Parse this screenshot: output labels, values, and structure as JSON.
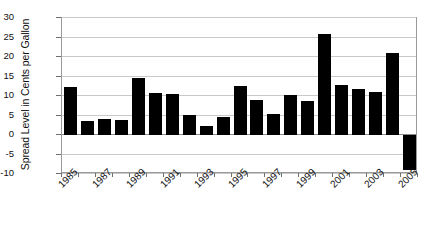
{
  "chart_data": {
    "type": "bar",
    "title": "",
    "subtitle": "",
    "xlabel": "",
    "ylabel": "Spread Level in Cents per Gallon",
    "categories": [
      "1985",
      "1986",
      "1987",
      "1988",
      "1989",
      "1990",
      "1991",
      "1992",
      "1993",
      "1994",
      "1995",
      "1996",
      "1997",
      "1998",
      "1999",
      "2000",
      "2001",
      "2002",
      "2003",
      "2004",
      "2005"
    ],
    "values": [
      12.2,
      3.7,
      4.1,
      3.9,
      14.5,
      10.7,
      10.4,
      5.2,
      2.4,
      4.6,
      12.6,
      9.0,
      5.3,
      10.2,
      8.7,
      25.9,
      12.8,
      11.8,
      10.9,
      20.9,
      -9.0
    ],
    "series": [
      {
        "name": "Spread Level",
        "values": [
          12.2,
          3.7,
          4.1,
          3.9,
          14.5,
          10.7,
          10.4,
          5.2,
          2.4,
          4.6,
          12.6,
          9.0,
          5.3,
          10.2,
          8.7,
          25.9,
          12.8,
          11.8,
          10.9,
          20.9,
          -9.0
        ]
      }
    ],
    "ylim": [
      -10,
      30
    ],
    "y_ticks": [
      30,
      25,
      20,
      15,
      10,
      5,
      0,
      -5,
      -10
    ],
    "y_tick_labels": [
      "30",
      "25",
      "20",
      "15",
      "10",
      "5",
      "0",
      "-5",
      "-10"
    ],
    "x_tick_labels": [
      "1985",
      "1987",
      "1989",
      "1991",
      "1993",
      "1995",
      "1997",
      "1999",
      "2001",
      "2003",
      "2005"
    ],
    "x_tick_label_indices": [
      0,
      2,
      4,
      6,
      8,
      10,
      12,
      14,
      16,
      18,
      20
    ],
    "grid": true,
    "grid_axis": "y",
    "legend": false,
    "legend_position": "none",
    "bar_color": "#000000",
    "grid_color": "#c9c9c9",
    "axis_color": "#9a9a9a",
    "background_color": "#ffffff",
    "annotations": []
  }
}
